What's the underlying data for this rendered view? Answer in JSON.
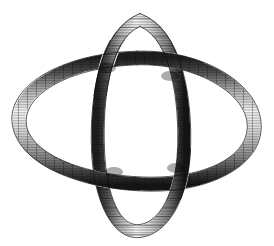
{
  "figure": {
    "title": "Interlocking Double Loop Knot",
    "description": "Engraved-style line drawing of two interlocking ribbon tubes forming a knot",
    "style": "cross-hatched engraving",
    "background_color": "#ffffff",
    "ink_color": "#1a1a1a",
    "shade_light": "#d8d8d8",
    "shade_mid": "#8a8a8a",
    "shade_dark": "#2b2b2b",
    "canvas": {
      "width": 274,
      "height": 246
    }
  },
  "components": [
    {
      "id": "horizontal-loop",
      "label": "Large tilted horizontal ribbon loop",
      "orientation": "horizontal",
      "tube_width": 13,
      "center": {
        "x": 137,
        "y": 120
      },
      "radius_x": 118,
      "radius_y": 62,
      "tilt_degrees": -12
    },
    {
      "id": "vertical-loop",
      "label": "Narrow vertical ribbon loop",
      "orientation": "vertical",
      "tube_width": 12,
      "center": {
        "x": 140,
        "y": 122
      },
      "radius_x": 42,
      "radius_y": 110,
      "tilt_degrees": 3
    }
  ],
  "crossings": [
    {
      "id": "crossing-top-left",
      "x": 107,
      "y": 68,
      "over": "vertical-loop"
    },
    {
      "id": "crossing-top-right",
      "x": 170,
      "y": 76,
      "over": "horizontal-loop"
    },
    {
      "id": "crossing-bottom-left",
      "x": 114,
      "y": 172,
      "over": "horizontal-loop"
    },
    {
      "id": "crossing-bottom-right",
      "x": 176,
      "y": 168,
      "over": "vertical-loop"
    }
  ],
  "hatching": {
    "band_count": 34,
    "line_spacing_px": 1.6,
    "direction": "along-tube",
    "edge_emphasis": true
  }
}
